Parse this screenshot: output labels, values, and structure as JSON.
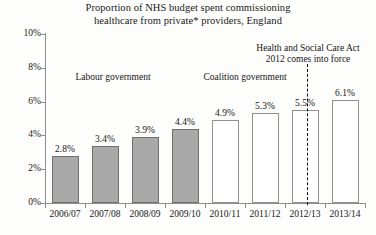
{
  "chart_data": {
    "type": "bar",
    "title": "Proportion of NHS budget spent commissioning healthcare from private* providers, England",
    "title_lines": [
      "Proportion of NHS budget spent commissioning",
      "healthcare from private* providers, England"
    ],
    "xlabel": "",
    "ylabel": "",
    "ylim": [
      0,
      10
    ],
    "grid": false,
    "legend": "none",
    "categories": [
      "2006/07",
      "2007/08",
      "2008/09",
      "2009/10",
      "2010/11",
      "2011/12",
      "2012/13",
      "2013/14"
    ],
    "values": [
      2.8,
      3.4,
      3.9,
      4.4,
      4.9,
      5.3,
      5.5,
      6.1
    ],
    "value_labels": [
      "2.8%",
      "3.4%",
      "3.9%",
      "4.4%",
      "4.9%",
      "5.3%",
      "5.5%",
      "6.1%"
    ],
    "bar_styles": [
      "filled",
      "filled",
      "filled",
      "filled",
      "hollow",
      "hollow",
      "hollow",
      "hollow"
    ],
    "ytick_values": [
      0,
      2,
      4,
      6,
      8,
      10
    ],
    "ytick_labels": [
      "0%",
      "2%",
      "4%",
      "6%",
      "8%",
      "10%"
    ],
    "annotations": [
      {
        "name": "labour-era",
        "text": "Labour government"
      },
      {
        "name": "coalition-era",
        "text": "Coalition government"
      },
      {
        "name": "hsc-act-event",
        "lines": [
          "Health and Social Care Act",
          "2012 comes into force"
        ]
      }
    ],
    "colors": {
      "bar_fill": "#a9a9a9",
      "bar_border": "#6f6f6f",
      "hollow_fill": "#ffffff",
      "hollow_border": "#909090",
      "axis": "#8e8e8e",
      "text": "#1a1a1a",
      "divider": "#111111",
      "background": "#fdfdfc"
    }
  }
}
